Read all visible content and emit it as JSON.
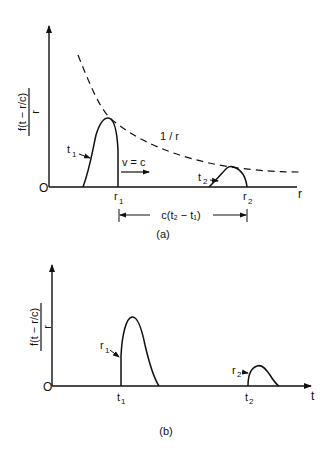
{
  "figure": {
    "panel_a": {
      "caption": "(a)",
      "y_label_num": "f(t − r/c)",
      "y_label_den": "r",
      "x_label": "r",
      "origin_label": "O",
      "curve_label": "1 / r",
      "pulse1_time_label": "t",
      "pulse1_time_sub": "1",
      "pulse2_time_label": "t",
      "pulse2_time_sub": "2",
      "velocity_label": "v = c",
      "r1_label": "r",
      "r1_sub": "1",
      "r2_label": "r",
      "r2_sub": "2",
      "distance_label": "c(t₂ − t₁)"
    },
    "panel_b": {
      "caption": "(b)",
      "y_label_num": "f(t − r/c)",
      "y_label_den": "r",
      "x_label": "t",
      "origin_label": "O",
      "pulse1_pos_label": "r",
      "pulse1_pos_sub": "1",
      "pulse2_pos_label": "r",
      "pulse2_pos_sub": "2",
      "t1_label": "t",
      "t1_sub": "1",
      "t2_label": "t",
      "t2_sub": "2"
    },
    "colors": {
      "ink": "#111111",
      "background": "#ffffff"
    }
  }
}
